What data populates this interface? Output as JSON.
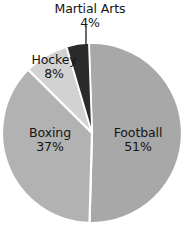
{
  "chart_data": {
    "type": "pie",
    "title": "",
    "categories": [
      "Football",
      "Boxing",
      "Hockey",
      "Martial Arts"
    ],
    "values": [
      51,
      37,
      8,
      4
    ],
    "value_unit": "%",
    "labels": [
      {
        "name": "Football",
        "pct": "51%",
        "value": 51,
        "color": "#a8a8a8",
        "placement": "inside"
      },
      {
        "name": "Boxing",
        "pct": "37%",
        "value": 37,
        "color": "#b2b2b2",
        "placement": "inside"
      },
      {
        "name": "Hockey",
        "pct": "8%",
        "value": 8,
        "color": "#d2d2d2",
        "placement": "inside"
      },
      {
        "name": "Martial Arts",
        "pct": "4%",
        "value": 4,
        "color": "#2b2b2b",
        "placement": "outside-callout"
      }
    ],
    "legend": "none",
    "grid": false,
    "start_angle_deg": -2,
    "direction": "clockwise",
    "slice_separator_color": "#ffffff",
    "background_color": "#ffffff"
  },
  "labels": {
    "martial_arts": {
      "name": "Martial Arts",
      "pct": "4%"
    },
    "hockey": {
      "name": "Hockey",
      "pct": "8%"
    },
    "boxing": {
      "name": "Boxing",
      "pct": "37%"
    },
    "football": {
      "name": "Football",
      "pct": "51%"
    }
  },
  "colors": {
    "football": "#a8a8a8",
    "boxing": "#b2b2b2",
    "hockey": "#d2d2d2",
    "martial_arts": "#2b2b2b",
    "separator": "#ffffff",
    "leader_line": "#1a1a1a",
    "text": "#141414",
    "background": "#ffffff"
  }
}
